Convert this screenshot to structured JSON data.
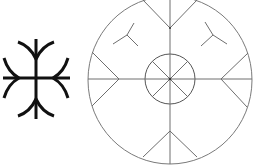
{
  "figure": {
    "description": "Two symbols: a bold runic cross with curved arms on the left and a large circle with inner circle, chevrons and small tripod marks on the right",
    "colors": {
      "background": "#ffffff",
      "bold_symbol_stroke": "#111111",
      "circle_symbol_stroke": "#6e6e6e",
      "circle_outline": "#7a7a7a",
      "center_dot": "#333333"
    },
    "left_symbol": {
      "name": "runic-cross",
      "vertical_bar": {
        "x": 36,
        "y1": 39,
        "y2": 119
      },
      "horizontal_bar": {
        "y": 78,
        "x1": 3,
        "x2": 70
      },
      "stroke_width": 3
    },
    "right_symbol": {
      "name": "circle-emblem",
      "outer_circle": {
        "cx": 170,
        "cy": 80,
        "rx": 82,
        "ry": 84
      },
      "inner_circle": {
        "cx": 170,
        "cy": 79,
        "r": 25
      },
      "stroke_width": 1
    }
  }
}
